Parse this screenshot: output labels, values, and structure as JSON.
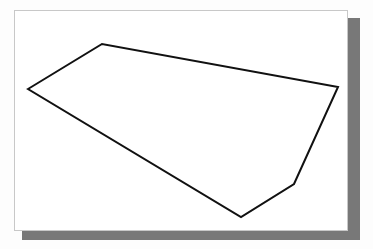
{
  "document": {
    "title": "Polygon figure",
    "background_color": "#fdfdfd"
  },
  "panel": {
    "name": "drawing-canvas",
    "fill_color": "#ffffff",
    "border_color": "#c8c8c8",
    "shadow_color": "#787878",
    "x": 14,
    "y": 10,
    "width": 334,
    "height": 221
  },
  "figure": {
    "type": "polygon",
    "label": "irregular convex pentagon outline",
    "stroke_color": "#111111",
    "fill_color": "none",
    "stroke_width": 2,
    "vertex_count": 5,
    "vertices": [
      {
        "name": "left-vertex",
        "x": 13,
        "y": 78
      },
      {
        "name": "top-vertex",
        "x": 87,
        "y": 33
      },
      {
        "name": "right-vertex",
        "x": 323,
        "y": 76
      },
      {
        "name": "lower-right-vertex",
        "x": 279,
        "y": 173
      },
      {
        "name": "bottom-vertex",
        "x": 226,
        "y": 206
      }
    ],
    "points_attr": "13,78 87,33 323,76 279,173 226,206"
  }
}
